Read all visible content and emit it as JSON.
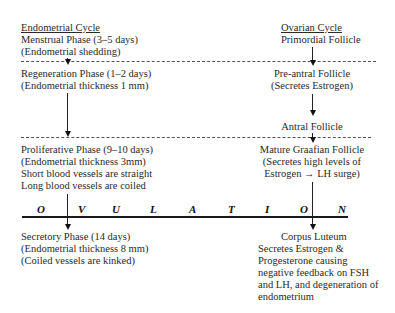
{
  "endometrial": {
    "header": "Endometrial Cycle",
    "menstrual": {
      "line1": "Menstrual Phase (3–5 days)",
      "line2": "(Endometrial shedding)"
    },
    "regeneration": {
      "line1": "Regeneration Phase (1–2 days)",
      "line2": "(Endometrial thickness 1 mm)"
    },
    "proliferative": {
      "line1": "Proliferative Phase (9–10 days)",
      "line2": "(Endometrial thickness 3mm)",
      "line3": "Short blood vessels are straight",
      "line4": "Long blood vessels are coiled"
    },
    "secretory": {
      "line1": "Secretory Phase (14 days)",
      "line2": "(Endometrial thickness 8 mm)",
      "line3": "(Coiled vessels are kinked)"
    }
  },
  "ovarian": {
    "header": "Ovarian Cycle",
    "primordial": "Primordial Follicle",
    "preantral": {
      "line1": "Pre-antral Follicle",
      "line2": "(Secretes Estrogen)"
    },
    "antral": "Antral Follicle",
    "graafian": {
      "line1": "Mature Graafian Follicle",
      "line2": "(Secretes high levels of",
      "line3": "Estrogen → LH surge)"
    },
    "corpus_luteum": {
      "title": "Corpus Luteum",
      "line1": "Secretes Estrogen &",
      "line2": "Progesterone causing",
      "line3": "negative feedback on FSH",
      "line4": "and LH, and degeneration of",
      "line5": "endometrium"
    }
  },
  "ovulation": {
    "letters": [
      "O",
      "V",
      "U",
      "L",
      "A",
      "T",
      "I",
      "O",
      "N"
    ]
  }
}
